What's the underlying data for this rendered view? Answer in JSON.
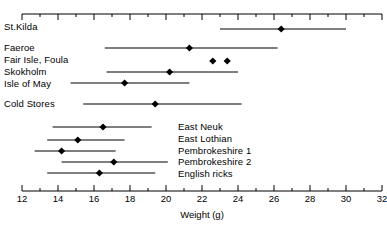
{
  "chart_data": {
    "type": "scatter",
    "title": "",
    "xlabel": "Weight (g)",
    "ylabel": "",
    "xlim": [
      12,
      32
    ],
    "xticks": [
      12,
      14,
      16,
      18,
      20,
      22,
      24,
      26,
      28,
      30,
      32
    ],
    "xtick_labels": [
      "12",
      "14",
      "16",
      "18",
      "20",
      "22",
      "24",
      "26",
      "28",
      "30",
      "32"
    ],
    "minor_tick_step": 1,
    "grid": false,
    "legend": "none",
    "axes": [
      "top",
      "bottom"
    ],
    "marker": "filled-diamond",
    "error_bar_style": "horizontal-range-line",
    "categories": [
      "St.Kilda",
      "Faeroe",
      "Fair Isle, Foula",
      "Skokholm",
      "Isle of May",
      "Cold Stores",
      "East Neuk",
      "East Lothian",
      "Pembrokeshire 1",
      "Pembrokeshire 2",
      "English ricks"
    ],
    "points": [
      {
        "label": "St.Kilda",
        "value": 26.4,
        "low": 23.0,
        "high": 30.0,
        "label_side": "left"
      },
      {
        "label": "Faeroe",
        "value": 21.3,
        "low": 16.6,
        "high": 26.2,
        "label_side": "left"
      },
      {
        "label": "Fair Isle, Foula",
        "value": 22.6,
        "low": null,
        "high": null,
        "label_side": "left",
        "extra_values": [
          23.4
        ]
      },
      {
        "label": "Skokholm",
        "value": 20.2,
        "low": 16.7,
        "high": 24.0,
        "label_side": "left"
      },
      {
        "label": "Isle of May",
        "value": 17.7,
        "low": 14.7,
        "high": 21.3,
        "label_side": "left"
      },
      {
        "label": "Cold Stores",
        "value": 19.4,
        "low": 15.4,
        "high": 24.2,
        "label_side": "left"
      },
      {
        "label": "East Neuk",
        "value": 16.5,
        "low": 13.7,
        "high": 19.2,
        "label_side": "right"
      },
      {
        "label": "East Lothian",
        "value": 15.1,
        "low": 13.4,
        "high": 17.7,
        "label_side": "right"
      },
      {
        "label": "Pembrokeshire 1",
        "value": 14.2,
        "low": 12.7,
        "high": 17.2,
        "label_side": "right"
      },
      {
        "label": "Pembrokeshire 2",
        "value": 17.1,
        "low": 14.2,
        "high": 20.1,
        "label_side": "right"
      },
      {
        "label": "English ricks",
        "value": 16.3,
        "low": 13.4,
        "high": 19.4,
        "label_side": "right"
      }
    ]
  },
  "labels": {
    "left_group": [
      {
        "text": "St.Kilda"
      },
      {
        "text": "Faeroe"
      },
      {
        "text": "Fair Isle, Foula"
      },
      {
        "text": "Skokholm"
      },
      {
        "text": "Isle of May"
      },
      {
        "text": "Cold Stores"
      }
    ],
    "right_group": [
      {
        "text": "East Neuk"
      },
      {
        "text": "East Lothian"
      },
      {
        "text": "Pembrokeshire 1"
      },
      {
        "text": "Pembrokeshire 2"
      },
      {
        "text": "English ricks"
      }
    ]
  },
  "axis": {
    "title": "Weight (g)",
    "ticks": [
      "12",
      "14",
      "16",
      "18",
      "20",
      "22",
      "24",
      "26",
      "28",
      "30",
      "32"
    ]
  },
  "colors": {
    "ink": "#000000",
    "background": "#ffffff"
  }
}
